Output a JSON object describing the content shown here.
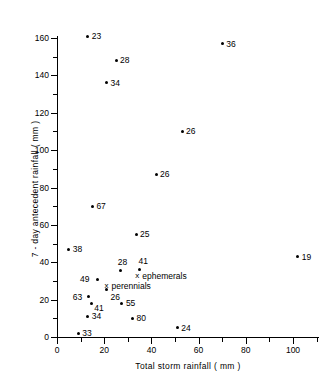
{
  "chart_data": {
    "type": "scatter",
    "title": "",
    "xlabel": "Total  storm  rainfall  ( mm )",
    "ylabel": "7 - day  antecedent  rainfall  ( mm )",
    "xlim": [
      0,
      111
    ],
    "ylim": [
      0,
      170
    ],
    "xticks": [
      0,
      20,
      40,
      60,
      80,
      100
    ],
    "yticks": [
      0,
      20,
      40,
      60,
      80,
      100,
      120,
      140,
      160
    ],
    "xminor": [
      10,
      30,
      50,
      70,
      90,
      110
    ],
    "yminor": [
      10,
      30,
      50,
      70,
      90,
      110,
      130,
      150,
      170
    ],
    "grid": false,
    "legend_position": "inside-center",
    "point_label_note": "each point is annotated with a count value",
    "points": [
      {
        "label": "23",
        "x": 13,
        "y": 161,
        "label_dx": 4,
        "label_dy": -4
      },
      {
        "label": "36",
        "x": 70,
        "y": 157,
        "label_dx": 4,
        "label_dy": -4
      },
      {
        "label": "28",
        "x": 25,
        "y": 148,
        "label_dx": 4,
        "label_dy": -4
      },
      {
        "label": "34",
        "x": 21,
        "y": 136,
        "label_dx": 4,
        "label_dy": -4
      },
      {
        "label": "26",
        "x": 53,
        "y": 110,
        "label_dx": 4,
        "label_dy": -4
      },
      {
        "label": "26",
        "x": 42,
        "y": 87,
        "label_dx": 4,
        "label_dy": -4
      },
      {
        "label": "67",
        "x": 15,
        "y": 70,
        "label_dx": 4,
        "label_dy": -4
      },
      {
        "label": "25",
        "x": 33.5,
        "y": 55,
        "label_dx": 4,
        "label_dy": -4
      },
      {
        "label": "38",
        "x": 5,
        "y": 47,
        "label_dx": 4,
        "label_dy": -4
      },
      {
        "label": "19",
        "x": 102,
        "y": 43,
        "label_dx": 4,
        "label_dy": -4
      },
      {
        "label": "41",
        "x": 35,
        "y": 36,
        "label_dx": -1,
        "label_dy": -13
      },
      {
        "label": "28",
        "x": 27,
        "y": 35.5,
        "label_dx": -3,
        "label_dy": -13
      },
      {
        "label": "49",
        "x": 17,
        "y": 31,
        "label_dx": -17,
        "label_dy": -4
      },
      {
        "label": "26",
        "x": 21,
        "y": 25.5,
        "label_dx": 4,
        "label_dy": 4
      },
      {
        "label": "63",
        "x": 13.5,
        "y": 21.5,
        "label_dx": -16,
        "label_dy": -4
      },
      {
        "label": "41",
        "x": 14.5,
        "y": 18,
        "label_dx": 3,
        "label_dy": 1
      },
      {
        "label": "55",
        "x": 27.5,
        "y": 18,
        "label_dx": 4,
        "label_dy": -4
      },
      {
        "label": "34",
        "x": 13,
        "y": 11,
        "label_dx": 4,
        "label_dy": -4
      },
      {
        "label": "80",
        "x": 32,
        "y": 10,
        "label_dx": 4,
        "label_dy": -4
      },
      {
        "label": "24",
        "x": 51,
        "y": 5,
        "label_dx": 4,
        "label_dy": -4
      },
      {
        "label": "33",
        "x": 9,
        "y": 2,
        "label_dx": 4,
        "label_dy": -4
      }
    ],
    "legend": [
      {
        "marker": "x",
        "label": "ephemerals",
        "x": 34,
        "y": 32.5
      },
      {
        "marker": "x",
        "label": "perennials",
        "x": 21,
        "y": 27.5
      }
    ]
  }
}
